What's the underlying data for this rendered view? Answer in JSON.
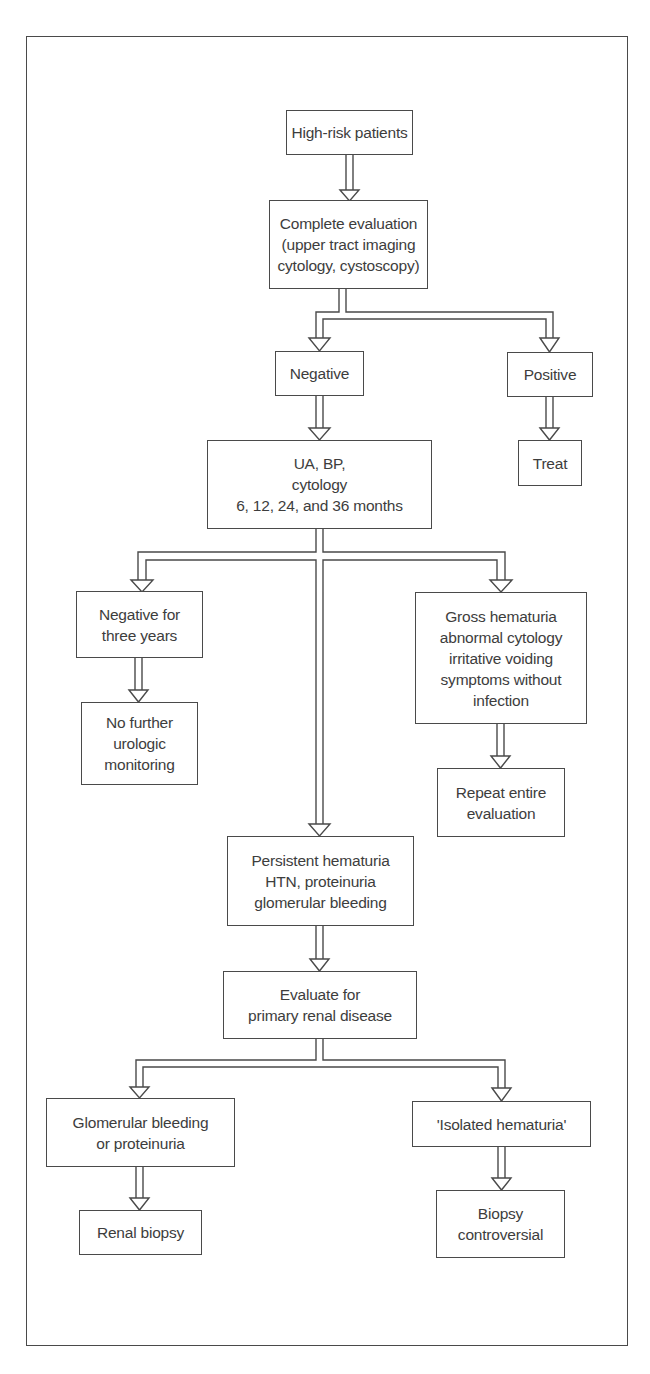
{
  "diagram": {
    "type": "flowchart",
    "nodes": [
      {
        "id": "high_risk",
        "label": "High-risk patients",
        "box": [
          286,
          110,
          127,
          45
        ]
      },
      {
        "id": "complete_eval",
        "label": "Complete evaluation\n(upper tract imaging\ncytology, cystoscopy)",
        "box": [
          269,
          200,
          159,
          89
        ]
      },
      {
        "id": "negative",
        "label": "Negative",
        "box": [
          275,
          351,
          89,
          45
        ]
      },
      {
        "id": "positive",
        "label": "Positive",
        "box": [
          507,
          352,
          86,
          45
        ]
      },
      {
        "id": "ua_bp",
        "label": "UA, BP,\ncytology\n6, 12, 24, and 36 months",
        "box": [
          207,
          440,
          225,
          89
        ]
      },
      {
        "id": "treat",
        "label": "Treat",
        "box": [
          518,
          440,
          64,
          46
        ]
      },
      {
        "id": "neg_three_years",
        "label": "Negative for\nthree years",
        "box": [
          76,
          591,
          127,
          67
        ]
      },
      {
        "id": "no_further",
        "label": "No further\nurologic\nmonitoring",
        "box": [
          81,
          702,
          117,
          83
        ]
      },
      {
        "id": "gross_hematuria",
        "label": "Gross hematuria\nabnormal cytology\nirritative voiding\nsymptoms without\ninfection",
        "box": [
          415,
          592,
          172,
          132
        ]
      },
      {
        "id": "repeat_eval",
        "label": "Repeat entire\nevaluation",
        "box": [
          437,
          768,
          128,
          69
        ]
      },
      {
        "id": "persistent",
        "label": "Persistent hematuria\nHTN, proteinuria\nglomerular bleeding",
        "box": [
          227,
          836,
          187,
          90
        ]
      },
      {
        "id": "evaluate_primary",
        "label": "Evaluate for\nprimary renal disease",
        "box": [
          223,
          971,
          194,
          68
        ]
      },
      {
        "id": "glomerular",
        "label": "Glomerular bleeding\nor proteinuria",
        "box": [
          46,
          1098,
          189,
          69
        ]
      },
      {
        "id": "renal_biopsy",
        "label": "Renal biopsy",
        "box": [
          79,
          1210,
          123,
          45
        ]
      },
      {
        "id": "isolated",
        "label": "'Isolated hematuria'",
        "box": [
          412,
          1101,
          179,
          46
        ]
      },
      {
        "id": "biopsy_controversial",
        "label": "Biopsy\ncontroversial",
        "box": [
          436,
          1190,
          129,
          68
        ]
      }
    ],
    "edges": [
      {
        "from": "high_risk",
        "to": "complete_eval"
      },
      {
        "from": "complete_eval",
        "to": "negative"
      },
      {
        "from": "complete_eval",
        "to": "positive"
      },
      {
        "from": "negative",
        "to": "ua_bp"
      },
      {
        "from": "positive",
        "to": "treat"
      },
      {
        "from": "ua_bp",
        "to": "neg_three_years"
      },
      {
        "from": "ua_bp",
        "to": "gross_hematuria"
      },
      {
        "from": "ua_bp",
        "to": "persistent"
      },
      {
        "from": "neg_three_years",
        "to": "no_further"
      },
      {
        "from": "gross_hematuria",
        "to": "repeat_eval"
      },
      {
        "from": "persistent",
        "to": "evaluate_primary"
      },
      {
        "from": "evaluate_primary",
        "to": "glomerular"
      },
      {
        "from": "evaluate_primary",
        "to": "isolated"
      },
      {
        "from": "glomerular",
        "to": "renal_biopsy"
      },
      {
        "from": "isolated",
        "to": "biopsy_controversial"
      }
    ],
    "colors": {
      "line": "#4a4a4a",
      "text": "#3d3d3d",
      "background": "#ffffff"
    }
  }
}
